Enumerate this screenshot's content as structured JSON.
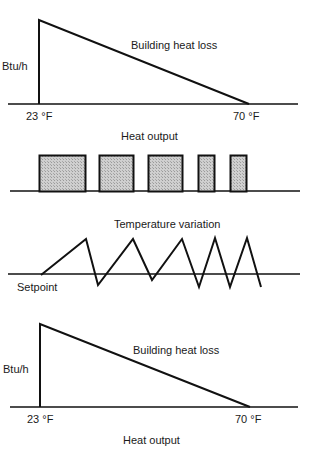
{
  "diagram": {
    "panels": [
      {
        "id": "heat-loss-top",
        "title": "Building heat loss",
        "y_label": "Btu/h",
        "x_left_label": "23 °F",
        "x_right_label": "70 °F"
      },
      {
        "id": "heat-output",
        "title": "Heat output",
        "bars": [
          {
            "x0": 39,
            "x1": 86
          },
          {
            "x0": 99,
            "x1": 134
          },
          {
            "x0": 148,
            "x1": 183
          },
          {
            "x0": 198,
            "x1": 215
          },
          {
            "x0": 230,
            "x1": 247
          }
        ]
      },
      {
        "id": "temperature-variation",
        "title": "Temperature variation",
        "baseline_label": "Setpoint"
      },
      {
        "id": "heat-loss-bottom",
        "title": "Building heat loss",
        "y_label": "Btu/h",
        "x_left_label": "23 °F",
        "x_right_label": "70 °F",
        "caption": "Heat output"
      }
    ],
    "colors": {
      "line": "#111111",
      "bar_fill": "#c4c4c4"
    }
  }
}
